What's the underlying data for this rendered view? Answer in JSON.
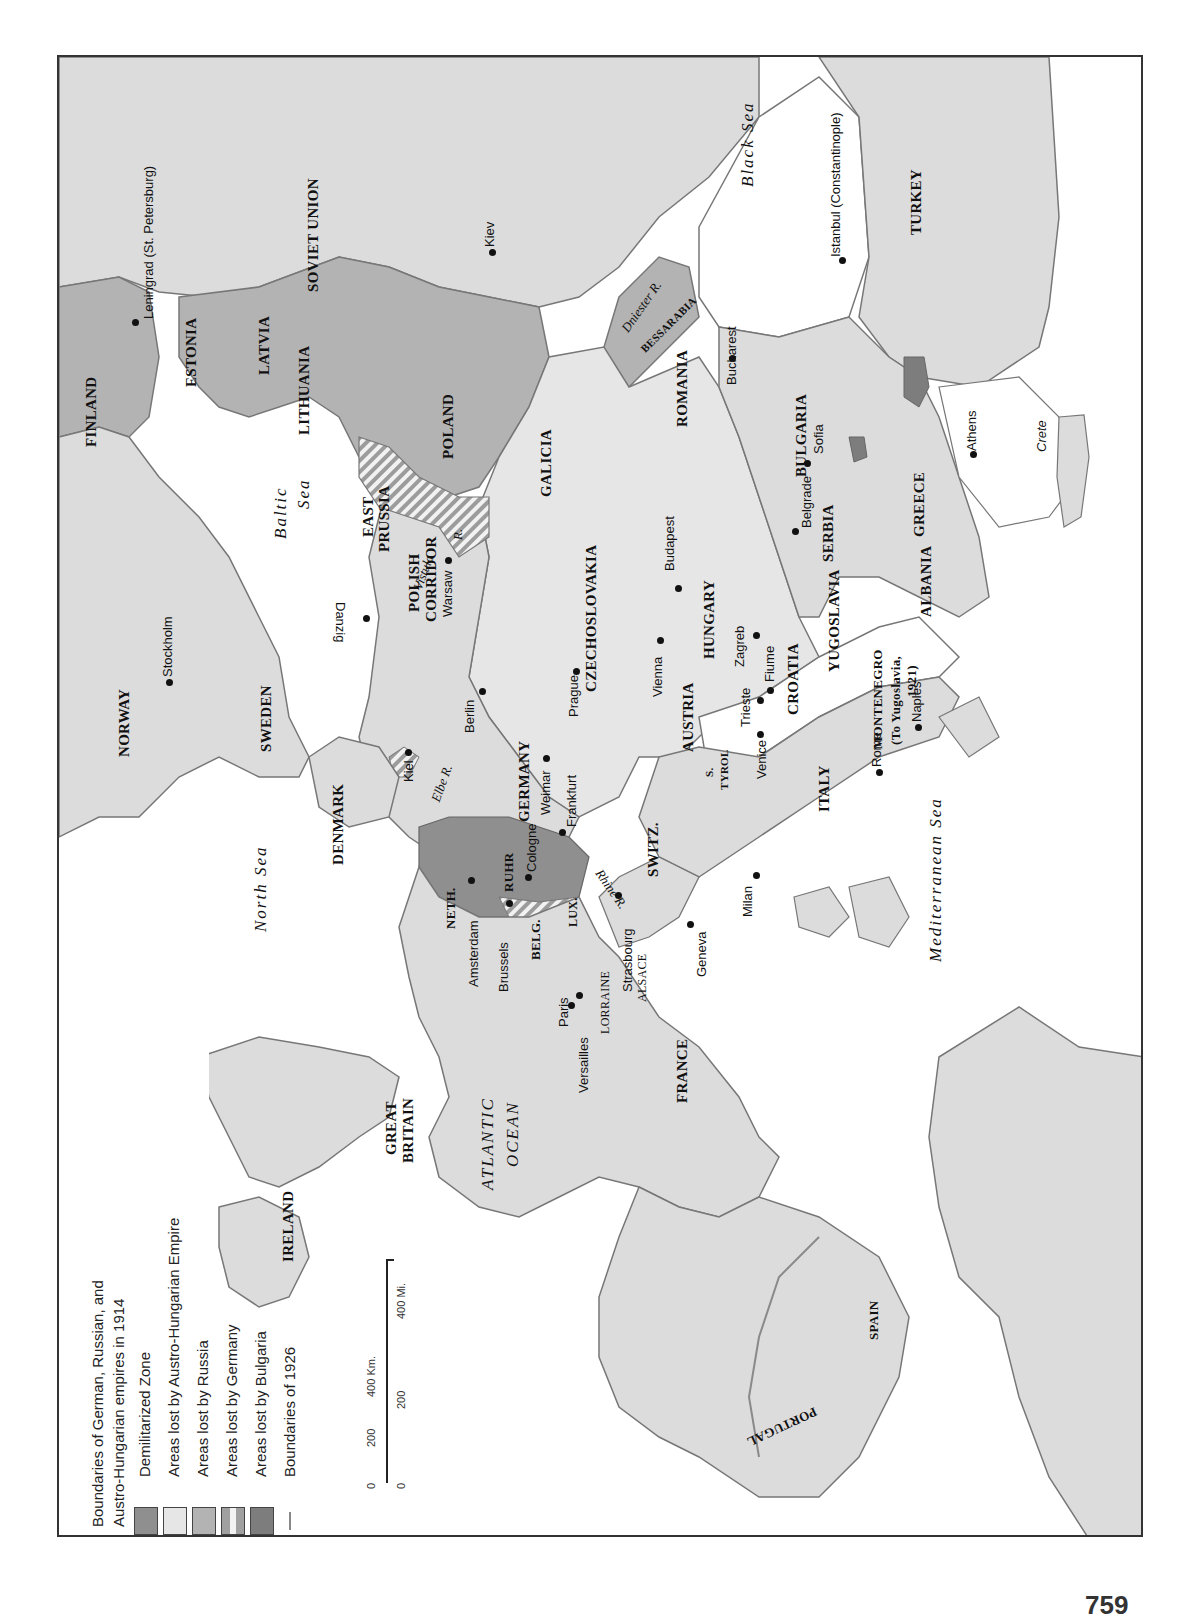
{
  "map": {
    "orientation": "rotated 90deg counter-clockwise (north at left)",
    "colors": {
      "land": "#dcdcdc",
      "sea": "#ffffff",
      "demilitarized": "#8f8f8f",
      "lost_austro_hungarian": "#e6e6e6",
      "lost_russia": "#b3b3b3",
      "lost_germany_stripe_a": "#a0a0a0",
      "lost_germany_stripe_b": "#f2f2f2",
      "lost_bulgaria": "#7d7d7d",
      "boundary_1914": "#6b6b6b",
      "boundary_1926": "#8a8a8a",
      "frame": "#333333"
    },
    "legend": {
      "items": [
        {
          "type": "line",
          "label_line1": "Boundaries of German, Russian, and",
          "label_line2": "Austro-Hungarian  empires in 1914"
        },
        {
          "type": "swatch",
          "label": "Demilitarized Zone"
        },
        {
          "type": "swatch",
          "label": "Areas lost by Austro-Hungarian Empire"
        },
        {
          "type": "swatch",
          "label": "Areas lost by Russia"
        },
        {
          "type": "swatch",
          "label": "Areas lost by Germany"
        },
        {
          "type": "swatch",
          "label": "Areas lost by Bulgaria"
        },
        {
          "type": "line",
          "label": "Boundaries of 1926"
        }
      ]
    },
    "scale": {
      "km_labels": [
        "0",
        "200",
        "400 Km."
      ],
      "mi_labels": [
        "0",
        "200",
        "400 Mi."
      ]
    },
    "seas": [
      "North Sea",
      "Baltic Sea",
      "Black Sea",
      "Mediterranean Sea",
      "ATLANTIC OCEAN"
    ],
    "countries": [
      "FINLAND",
      "ESTONIA",
      "LATVIA",
      "LITHUANIA",
      "POLAND",
      "SOVIET UNION",
      "EAST PRUSSIA",
      "POLISH CORRIDOR",
      "GALICIA",
      "ROMANIA",
      "BESSARABIA",
      "BULGARIA",
      "TURKEY",
      "GREECE",
      "ALBANIA",
      "SERBIA",
      "YUGOSLAVIA",
      "CROATIA",
      "MONTENEGRO",
      "(To Yugoslavia, 1921)",
      "HUNGARY",
      "CZECHOSLOVAKIA",
      "AUSTRIA",
      "S. TYROL",
      "ITALY",
      "SWITZ.",
      "GERMANY",
      "RUHR",
      "LUX.",
      "BELG.",
      "NETH.",
      "ALSACE",
      "LORRAINE",
      "FRANCE",
      "SPAIN",
      "PORTUGAL",
      "DENMARK",
      "SWEDEN",
      "NORWAY",
      "GREAT BRITAIN",
      "IRELAND"
    ],
    "cities": [
      "Leningrad (St. Petersburg)",
      "Kiev",
      "Istanbul (Constantinople)",
      "Bucharest",
      "Sofia",
      "Athens",
      "Belgrade",
      "Budapest",
      "Warsaw",
      "Danzig",
      "Stockholm",
      "Vienna",
      "Zagreb",
      "Fiume",
      "Trieste",
      "Venice",
      "Rome",
      "Naples",
      "Milan",
      "Geneva",
      "Prague",
      "Berlin",
      "Weimar",
      "Frankfurt",
      "Cologne",
      "Kiel",
      "Strasbourg",
      "Amsterdam",
      "Brussels",
      "Paris",
      "Versailles"
    ],
    "rivers": [
      "Dniester R.",
      "Vistula R.",
      "Elbe R.",
      "Rhine R."
    ],
    "islands": [
      "Crete"
    ],
    "page_number": "759"
  },
  "labels": {
    "finland": "FINLAND",
    "estonia": "ESTONIA",
    "latvia": "LATVIA",
    "lithuania": "LITHUANIA",
    "poland": "POLAND",
    "soviet_union": "SOVIET UNION",
    "east": "EAST",
    "prussia": "PRUSSIA",
    "polish": "POLISH",
    "corridor": "CORRIDOR",
    "galicia": "GALICIA",
    "romania": "ROMANIA",
    "bessarabia": "BESSARABIA",
    "bulgaria": "BULGARIA",
    "turkey": "TURKEY",
    "greece": "GREECE",
    "albania": "ALBANIA",
    "serbia": "SERBIA",
    "yugoslavia": "YUGOSLAVIA",
    "croatia": "CROATIA",
    "montenegro": "MONTENEGRO",
    "montenegro_note1": "(To Yugoslavia,",
    "montenegro_note2": "1921)",
    "hungary": "HUNGARY",
    "czechoslovakia": "CZECHOSLOVAKIA",
    "austria": "AUSTRIA",
    "s": "S.",
    "tyrol": "TYROL",
    "italy": "ITALY",
    "switz": "SWITZ.",
    "germany": "GERMANY",
    "ruhr": "RUHR",
    "lux": "LUX.",
    "belg": "BELG.",
    "neth": "NETH.",
    "alsace": "ALSACE",
    "lorraine": "LORRAINE",
    "france": "FRANCE",
    "spain": "SPAIN",
    "portugal": "PORTUGAL",
    "denmark": "DENMARK",
    "sweden": "SWEDEN",
    "norway": "NORWAY",
    "great": "GREAT",
    "britain": "BRITAIN",
    "ireland": "IRELAND",
    "north_sea": "North Sea",
    "baltic": "Baltic",
    "sea": "Sea",
    "black_sea": "Black Sea",
    "med_sea": "Mediterranean Sea",
    "atlantic": "ATLANTIC",
    "ocean": "OCEAN",
    "leningrad": "Leningrad (St. Petersburg)",
    "kiev": "Kiev",
    "istanbul": "Istanbul (Constantinople)",
    "bucharest": "Bucharest",
    "sofia": "Sofia",
    "athens": "Athens",
    "crete": "Crete",
    "belgrade": "Belgrade",
    "budapest": "Budapest",
    "warsaw": "Warsaw",
    "danzig": "Danzig",
    "stockholm": "Stockholm",
    "vienna": "Vienna",
    "zagreb": "Zagreb",
    "fiume": "Fiume",
    "trieste": "Trieste",
    "venice": "Venice",
    "rome": "Rome",
    "naples": "Naples",
    "milan": "Milan",
    "geneva": "Geneva",
    "prague": "Prague",
    "berlin": "Berlin",
    "weimar": "Weimar",
    "frankfurt": "Frankfurt",
    "cologne": "Cologne",
    "kiel": "Kiel",
    "strasbourg": "Strasbourg",
    "amsterdam": "Amsterdam",
    "brussels": "Brussels",
    "paris": "Paris",
    "versailles": "Versailles",
    "dniester": "Dniester R.",
    "vistula": "Vistula",
    "vistula_r": "R.",
    "elbe": "Elbe R.",
    "rhine": "Rhine R."
  }
}
